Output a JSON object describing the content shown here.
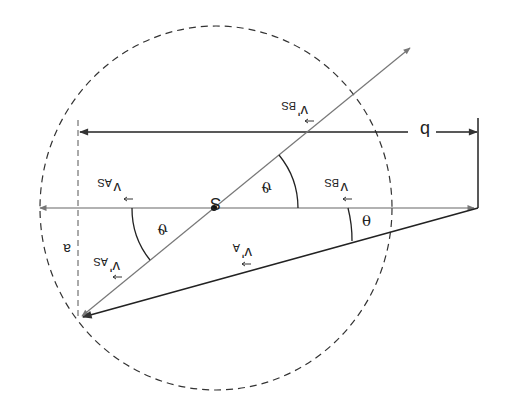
{
  "figure": {
    "orientation": "rotated-180",
    "labels": {
      "center": "S",
      "v_as_top": "v",
      "v_as_top_sub": "AS",
      "v_bs_mid": "v",
      "v_bs_mid_sub": "BS",
      "v_bs_prime": "v'",
      "v_bs_prime_sub": "BS",
      "v_as_prime": "v'",
      "v_as_prime_sub": "AS",
      "v_a_prime": "v'",
      "v_a_prime_sub": "A",
      "theta": "θ",
      "vartheta_1": "ϑ",
      "vartheta_2": "ϑ",
      "impact_b": "b",
      "impact_a": "a"
    },
    "colors": {
      "line": "#222222",
      "light_line": "#666666",
      "background": "#ffffff"
    }
  }
}
